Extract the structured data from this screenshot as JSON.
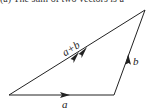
{
  "caption": "(a) The sum of two vectors is a",
  "diagram": {
    "type": "vector-addition-triangle",
    "points": {
      "origin": [
        9,
        95
      ],
      "a_end": [
        114,
        95
      ],
      "b_end": [
        145,
        10
      ]
    },
    "vectors": [
      {
        "name": "a",
        "label": "a",
        "from": "origin",
        "to": "a_end",
        "arrowheads": 1
      },
      {
        "name": "b",
        "label": "b",
        "from": "a_end",
        "to": "b_end",
        "arrowheads": 1
      },
      {
        "name": "a_plus_b",
        "label": "a+b",
        "from": "origin",
        "to": "b_end",
        "arrowheads": 2
      }
    ],
    "stroke_color": "#222222"
  }
}
